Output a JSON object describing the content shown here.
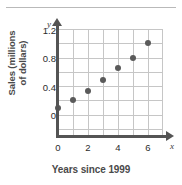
{
  "chart_data": {
    "type": "scatter",
    "title": "",
    "xlabel": "Years since 1999",
    "ylabel": "Sales (millions of dollars)",
    "ylabel_lines": [
      "Sales (millions",
      "of dollars)"
    ],
    "x_axis_letter": "x",
    "y_axis_letter": "y",
    "x": [
      0,
      1,
      2,
      3,
      4,
      5,
      6
    ],
    "values": [
      0.39,
      0.5,
      0.63,
      0.79,
      0.96,
      1.1,
      1.3
    ],
    "points": [
      {
        "x": 0,
        "y": 0.39
      },
      {
        "x": 1,
        "y": 0.5
      },
      {
        "x": 2,
        "y": 0.63
      },
      {
        "x": 3,
        "y": 0.79
      },
      {
        "x": 4,
        "y": 0.96
      },
      {
        "x": 5,
        "y": 1.1
      },
      {
        "x": 6,
        "y": 1.3
      }
    ],
    "xlim": [
      0,
      7
    ],
    "ylim": [
      0,
      1.5
    ],
    "xticks": [
      0,
      2,
      4,
      6
    ],
    "xtick_labels": [
      "0",
      "2",
      "4",
      "6"
    ],
    "yticks": [
      0,
      0.4,
      0.8,
      1.2
    ],
    "ytick_labels": [
      "0",
      "0.4",
      "0.8",
      "1.2"
    ],
    "x_gridlines": [
      0,
      1,
      2,
      3,
      4,
      5,
      6,
      7
    ],
    "y_gridlines": [
      0,
      0.2,
      0.4,
      0.6,
      0.8,
      1.0,
      1.2,
      1.4
    ],
    "grid": true,
    "legend": null,
    "marker_color": "#5a5a5a",
    "grid_color": "#c6c6c6",
    "axis_color": "#545454",
    "label_color": "#4a4a4a"
  }
}
